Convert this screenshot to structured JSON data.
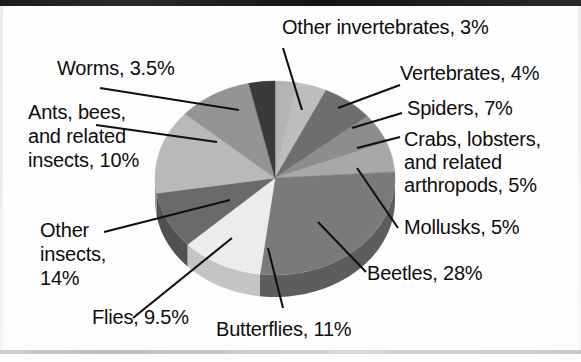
{
  "figure": {
    "background_color": "#fdfdfd",
    "text_color": "#0d0d0d"
  },
  "chart_data": {
    "type": "pie",
    "title": "",
    "xlabel": "",
    "ylabel": "",
    "legend_position": "callout-labels",
    "grid": false,
    "start_angle_deg": 0,
    "direction": "clockwise",
    "three_d": true,
    "categories": [
      "Other invertebrates",
      "Vertebrates",
      "Spiders",
      "Crabs, lobsters, and related arthropods",
      "Mollusks",
      "Beetles",
      "Butterflies",
      "Flies",
      "Other insects",
      "Ants, bees, and related insects",
      "Worms"
    ],
    "values": [
      3,
      4,
      7,
      5,
      5,
      28,
      11,
      9.5,
      14,
      10,
      3.5
    ],
    "colors": [
      "#b4b4b4",
      "#bdbdbd",
      "#6e6e6e",
      "#8d8d8d",
      "#a8a8a8",
      "#7a7a7a",
      "#ececec",
      "#6a6a6a",
      "#b9b9b9",
      "#949494",
      "#3a3a3a"
    ],
    "side_colors": [
      "#8f8f8f",
      "#979797",
      "#545454",
      "#6d6d6d",
      "#848484",
      "#5d5d5d",
      "#c4c4c4",
      "#515151",
      "#939393",
      "#727272",
      "#2b2b2b"
    ],
    "data_labels": [
      "Other invertebrates, 3%",
      "Vertebrates, 4%",
      "Spiders, 7%",
      "Crabs, lobsters, and related arthropods, 5%",
      "Mollusks, 5%",
      "Beetles, 28%",
      "Butterflies, 11%",
      "Flies, 9.5%",
      "Other insects, 14%",
      "Ants, bees, and related insects, 10%",
      "Worms, 3.5%"
    ]
  },
  "labels": {
    "other_invertebrates": "Other invertebrates, 3%",
    "vertebrates": "Vertebrates, 4%",
    "spiders": "Spiders, 7%",
    "crabs_line1": "Crabs, lobsters,",
    "crabs_line2": "and related",
    "crabs_line3": "arthropods, 5%",
    "mollusks": "Mollusks, 5%",
    "beetles": "Beetles, 28%",
    "butterflies": "Butterflies, 11%",
    "flies": "Flies, 9.5%",
    "other_insects_line1": "Other",
    "other_insects_line2": "insects,",
    "other_insects_line3": "14%",
    "ants_line1": "Ants, bees,",
    "ants_line2": "and related",
    "ants_line3": "insects, 10%",
    "worms": "Worms, 3.5%"
  }
}
